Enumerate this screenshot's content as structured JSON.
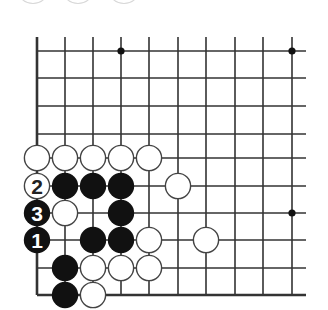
{
  "diagram": {
    "type": "go-board-diagram",
    "corner": "bottom-left",
    "grid": {
      "columns": 10,
      "rows": 10,
      "col_x": [
        37,
        65,
        93,
        121,
        149,
        178,
        206,
        235,
        263,
        292
      ],
      "row_y": [
        51,
        78,
        106,
        134,
        158,
        186,
        213,
        240,
        268,
        295
      ],
      "line_top": 37,
      "line_right": 306,
      "edges": [
        "left",
        "bottom"
      ],
      "line_color": "#333333"
    },
    "star_points": [
      {
        "col": 3,
        "row": 0
      },
      {
        "col": 9,
        "row": 0
      },
      {
        "col": 9,
        "row": 6
      }
    ],
    "stones": [
      {
        "color": "white",
        "col": 0,
        "row": 4,
        "label": ""
      },
      {
        "color": "white",
        "col": 1,
        "row": 4,
        "label": ""
      },
      {
        "color": "white",
        "col": 2,
        "row": 4,
        "label": ""
      },
      {
        "color": "white",
        "col": 3,
        "row": 4,
        "label": ""
      },
      {
        "color": "white",
        "col": 4,
        "row": 4,
        "label": ""
      },
      {
        "color": "white",
        "col": 0,
        "row": 5,
        "label": "2"
      },
      {
        "color": "black",
        "col": 1,
        "row": 5,
        "label": ""
      },
      {
        "color": "black",
        "col": 2,
        "row": 5,
        "label": ""
      },
      {
        "color": "black",
        "col": 3,
        "row": 5,
        "label": ""
      },
      {
        "color": "white",
        "col": 5,
        "row": 5,
        "label": ""
      },
      {
        "color": "black",
        "col": 0,
        "row": 6,
        "label": "3"
      },
      {
        "color": "white",
        "col": 1,
        "row": 6,
        "label": ""
      },
      {
        "color": "black",
        "col": 3,
        "row": 6,
        "label": ""
      },
      {
        "color": "black",
        "col": 0,
        "row": 7,
        "label": "1"
      },
      {
        "color": "black",
        "col": 2,
        "row": 7,
        "label": ""
      },
      {
        "color": "black",
        "col": 3,
        "row": 7,
        "label": ""
      },
      {
        "color": "white",
        "col": 4,
        "row": 7,
        "label": ""
      },
      {
        "color": "white",
        "col": 6,
        "row": 7,
        "label": ""
      },
      {
        "color": "black",
        "col": 1,
        "row": 8,
        "label": ""
      },
      {
        "color": "white",
        "col": 2,
        "row": 8,
        "label": ""
      },
      {
        "color": "white",
        "col": 3,
        "row": 8,
        "label": ""
      },
      {
        "color": "white",
        "col": 4,
        "row": 8,
        "label": ""
      },
      {
        "color": "black",
        "col": 1,
        "row": 9,
        "label": ""
      },
      {
        "color": "white",
        "col": 2,
        "row": 9,
        "label": ""
      }
    ],
    "cropped_top_circles_x": [
      33,
      78,
      124
    ]
  }
}
